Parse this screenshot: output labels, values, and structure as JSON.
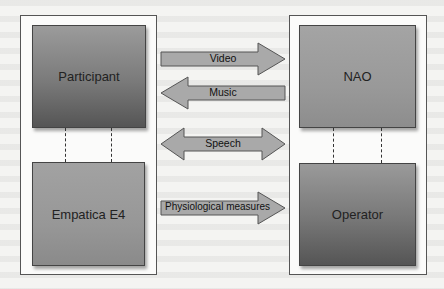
{
  "diagram": {
    "left_group": {
      "top_node": "Participant",
      "bottom_node": "Empatica E4"
    },
    "right_group": {
      "top_node": "NAO",
      "bottom_node": "Operator"
    },
    "arrows": [
      {
        "label": "Video",
        "direction": "right"
      },
      {
        "label": "Music",
        "direction": "left"
      },
      {
        "label": "Speech",
        "direction": "both"
      },
      {
        "label": "Physiological measures",
        "direction": "right"
      }
    ],
    "colors": {
      "node_dark": "#555555",
      "node_light": "#9a9a9a",
      "arrow_fill": "#a8a8a8",
      "border": "#444444"
    }
  }
}
